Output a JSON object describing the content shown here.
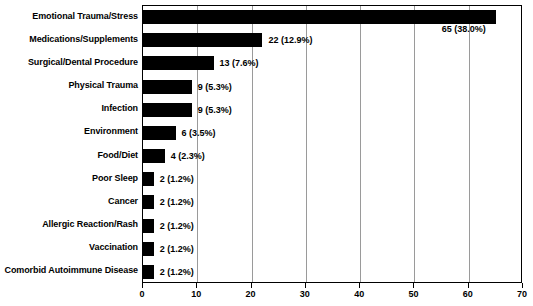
{
  "chart_data": {
    "type": "bar",
    "orientation": "horizontal",
    "title": "",
    "xlabel": "",
    "ylabel": "",
    "xlim": [
      0,
      70
    ],
    "xticks": [
      0,
      10,
      20,
      30,
      40,
      50,
      60,
      70
    ],
    "grid": true,
    "legend": null,
    "bar_color": "#000000",
    "gridline_color": "#9a9a9a",
    "axis_color": "#000000",
    "background": "#ffffff",
    "categories": [
      "Emotional Trauma/Stress",
      "Medications/Supplements",
      "Surgical/Dental Procedure",
      "Physical Trauma",
      "Infection",
      "Environment",
      "Food/Diet",
      "Poor Sleep",
      "Cancer",
      "Allergic Reaction/Rash",
      "Vaccination",
      "Comorbid Autoimmune Disease"
    ],
    "values": [
      65,
      22,
      13,
      9,
      9,
      6,
      4,
      2,
      2,
      2,
      2,
      2
    ],
    "percents": [
      38.0,
      12.9,
      7.6,
      5.3,
      5.3,
      3.5,
      2.3,
      1.2,
      1.2,
      1.2,
      1.2,
      1.2
    ],
    "data_labels": [
      "65 (38.0%)",
      "22 (12.9%)",
      "13 (7.6%)",
      "9 (5.3%)",
      "9 (5.3%)",
      "6 (3.5%)",
      "4 (2.3%)",
      "2 (1.2%)",
      "2 (1.2%)",
      "2 (1.2%)",
      "2 (1.2%)",
      "2 (1.2%)"
    ],
    "label_placement": [
      "below-inside-right",
      "right",
      "right",
      "right",
      "right",
      "right",
      "right",
      "right",
      "right",
      "right",
      "right",
      "right"
    ]
  }
}
